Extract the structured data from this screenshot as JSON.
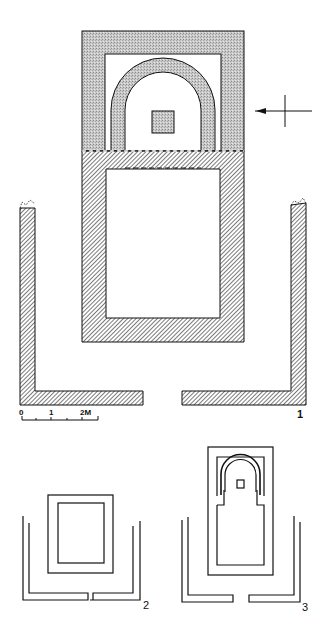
{
  "figures": [
    {
      "id": "1",
      "label": "1",
      "description": "Detailed plan with hatched and stippled walls, arch, central square and enclosure"
    },
    {
      "id": "2",
      "label": "2",
      "description": "Outline plan: rectangular room within enclosure"
    },
    {
      "id": "3",
      "label": "3",
      "description": "Outline plan: arched sanctuary with central square within enclosure"
    }
  ],
  "scale_bar": {
    "ticks": [
      "0",
      "1",
      "2M"
    ]
  },
  "orientation_marker": {
    "icon": "arrow-cross-icon",
    "direction": "left"
  },
  "colors": {
    "ink": "#111111",
    "stipple": "#bdbdbd",
    "hatch": "#333333",
    "background": "#ffffff"
  }
}
